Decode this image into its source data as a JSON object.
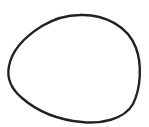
{
  "canvas": {
    "width": 149,
    "height": 127,
    "background": "#ffffff"
  },
  "shape": {
    "type": "closed-curve-outline",
    "stroke_color": "#222222",
    "stroke_width": 2.4,
    "fill": "none"
  }
}
